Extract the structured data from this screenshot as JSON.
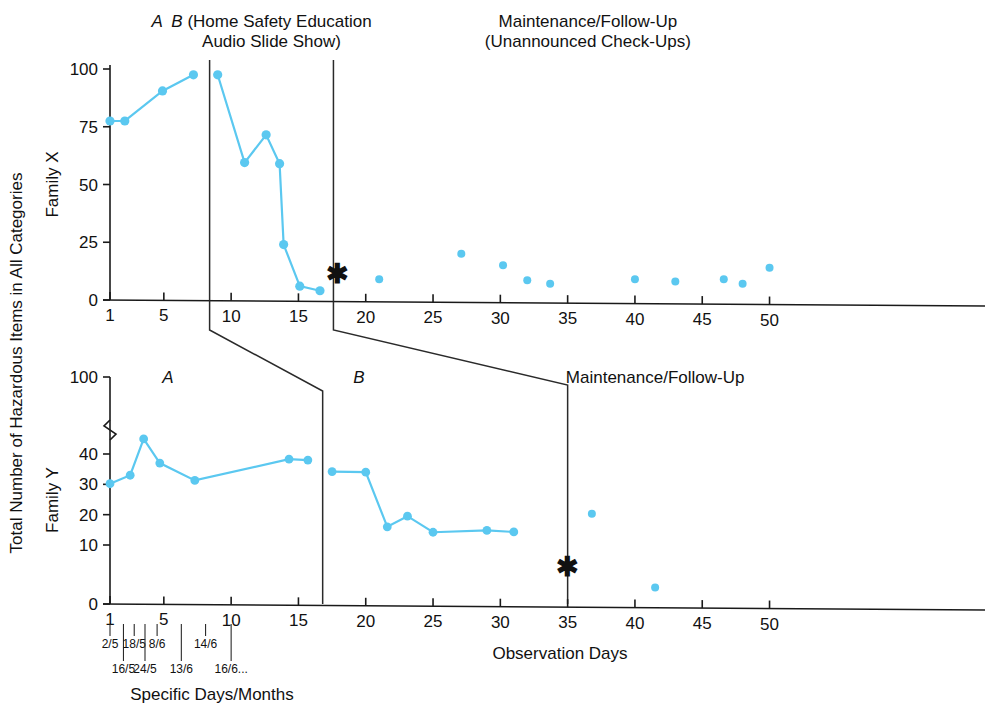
{
  "figure": {
    "y_axis_label": "Total Number of Hazardous Items in All Categories",
    "x_axis_label": "Observation Days",
    "secondary_x_axis_label": "Specific Days/Months",
    "series_color": "#5bc8f0",
    "axis_color": "#1a1a1a",
    "star_glyph": "✱"
  },
  "chart_data": [
    {
      "type": "line",
      "panel": "top",
      "title": "Family X",
      "ylabel": "Family X",
      "xlabel": "",
      "xlim": [
        0,
        53
      ],
      "ylim": [
        0,
        100
      ],
      "yticks": [
        0,
        25,
        50,
        75,
        100
      ],
      "ytick_labels": [
        "0",
        "25",
        "50",
        "75",
        "100"
      ],
      "xticks": [
        1,
        5,
        10,
        15,
        20,
        25,
        30,
        35,
        40,
        45,
        50
      ],
      "xtick_labels": [
        "1",
        "5",
        "10",
        "15",
        "20",
        "25",
        "30",
        "35",
        "40",
        "45",
        "50"
      ],
      "grid": false,
      "legend": "none",
      "phase_labels": [
        {
          "text": "A",
          "italic": true,
          "x": 4.5
        },
        {
          "text": "B (Home Safety Education",
          "italic_first": true,
          "x": 13.0
        },
        {
          "text": "Audio Slide Show)",
          "x": 13.0
        },
        {
          "text": "Maintenance/Follow-Up",
          "x": 36.5
        },
        {
          "text": "(Unannounced Check-Ups)",
          "x": 36.5
        }
      ],
      "phase_lines_x": [
        8.4,
        17.6
      ],
      "annotation_star_x": 17.9,
      "annotation_star_y": 9,
      "series": [
        {
          "name": "Family X Baseline A",
          "connected": true,
          "points": [
            [
              1.0,
              77.5
            ],
            [
              2.1,
              77.5
            ],
            [
              4.9,
              90.5
            ],
            [
              7.2,
              97.5
            ]
          ]
        },
        {
          "name": "Family X Intervention B",
          "connected": true,
          "points": [
            [
              9.0,
              97.5
            ],
            [
              11.0,
              59.5
            ],
            [
              12.6,
              71.5
            ],
            [
              13.6,
              59.0
            ],
            [
              13.9,
              24.0
            ],
            [
              15.1,
              6.0
            ],
            [
              16.6,
              4.0
            ]
          ]
        },
        {
          "name": "Family X Maintenance/Follow-Up",
          "connected": false,
          "points": [
            [
              21.0,
              9.0
            ],
            [
              27.1,
              20.0
            ],
            [
              30.2,
              15.0
            ],
            [
              32.0,
              8.5
            ],
            [
              33.7,
              7.0
            ],
            [
              40.0,
              9.0
            ],
            [
              43.0,
              8.0
            ],
            [
              46.6,
              9.0
            ],
            [
              48.0,
              7.0
            ],
            [
              50.0,
              14.0
            ]
          ]
        }
      ]
    },
    {
      "type": "line",
      "panel": "bottom",
      "title": "Family Y",
      "ylabel": "Family Y",
      "xlabel": "Observation Days",
      "xlim": [
        0,
        53
      ],
      "ylim": [
        0,
        100
      ],
      "y_axis_break": true,
      "yticks": [
        0,
        10,
        20,
        30,
        40,
        100
      ],
      "ytick_labels": [
        "0",
        "10",
        "20",
        "30",
        "40",
        "100"
      ],
      "xticks": [
        1,
        5,
        10,
        15,
        20,
        25,
        30,
        35,
        40,
        45,
        50
      ],
      "xtick_labels": [
        "1",
        "5",
        "10",
        "15",
        "20",
        "25",
        "30",
        "35",
        "40",
        "45",
        "50"
      ],
      "grid": false,
      "legend": "none",
      "phase_labels": [
        {
          "text": "A",
          "italic": true,
          "x": 5.3
        },
        {
          "text": "B",
          "italic": true,
          "x": 19.5
        },
        {
          "text": "Maintenance/Follow-Up",
          "x": 41.5
        }
      ],
      "phase_lines_x": [
        16.8,
        35.0
      ],
      "annotation_star_x": 35.0,
      "annotation_star_y": 5.5,
      "series": [
        {
          "name": "Family Y Baseline A",
          "connected": true,
          "points": [
            [
              1.0,
              30.2
            ],
            [
              2.5,
              33.0
            ],
            [
              3.5,
              41.0
            ],
            [
              4.7,
              37.0
            ],
            [
              7.3,
              31.3
            ],
            [
              14.3,
              38.3
            ],
            [
              15.7,
              38.0
            ]
          ]
        },
        {
          "name": "Family Y Intervention B",
          "connected": true,
          "points": [
            [
              17.5,
              34.2
            ],
            [
              20.0,
              34.0
            ],
            [
              21.6,
              16.0
            ],
            [
              23.1,
              19.5
            ],
            [
              25.0,
              14.2
            ],
            [
              29.0,
              14.8
            ],
            [
              31.0,
              14.3
            ]
          ]
        },
        {
          "name": "Family Y Maintenance/Follow-Up",
          "connected": false,
          "points": [
            [
              36.8,
              20.3
            ],
            [
              41.5,
              2.8
            ]
          ]
        }
      ],
      "date_ticks": [
        {
          "label": "2/5",
          "x": 1.0,
          "row": 1
        },
        {
          "label": "16/5",
          "x": 2.0,
          "row": 2
        },
        {
          "label": "18/5",
          "x": 2.8,
          "row": 1
        },
        {
          "label": "24/5",
          "x": 3.6,
          "row": 2
        },
        {
          "label": "8/6",
          "x": 4.5,
          "row": 1
        },
        {
          "label": "13/6",
          "x": 6.3,
          "row": 2
        },
        {
          "label": "14/6",
          "x": 8.1,
          "row": 1
        },
        {
          "label": "16/6...",
          "x": 10.0,
          "row": 2
        }
      ]
    }
  ]
}
